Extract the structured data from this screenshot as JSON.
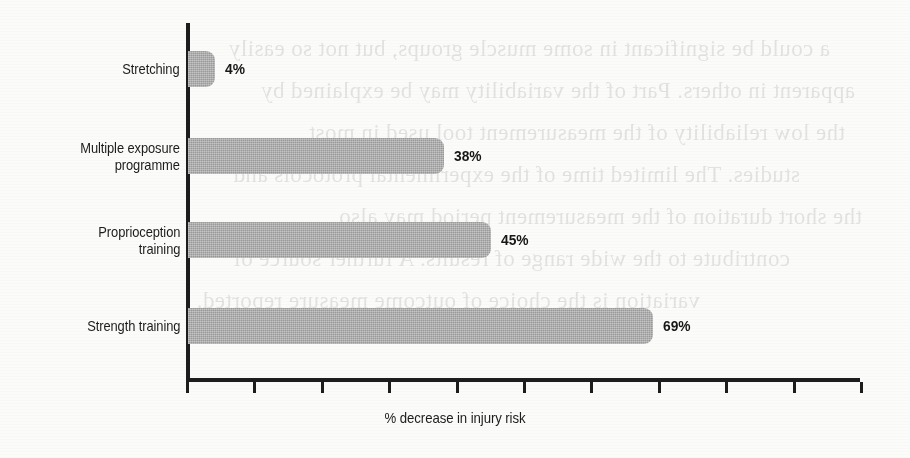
{
  "chart_data": {
    "type": "bar",
    "orientation": "horizontal",
    "title": "",
    "subtitle": "",
    "xlabel": "% decrease in injury risk",
    "ylabel": "",
    "categories": [
      "Stretching",
      "Multiple exposure\nprogramme",
      "Proprioception\ntraining",
      "Strength training"
    ],
    "values": [
      4,
      38,
      45,
      69
    ],
    "value_labels": [
      "4%",
      "38%",
      "45%",
      "69%"
    ],
    "xlim": [
      0,
      100
    ],
    "ylim": null,
    "x_tick_values": [
      0,
      10,
      20,
      30,
      40,
      50,
      60,
      70,
      80,
      90,
      100
    ],
    "x_tick_labels": [
      "",
      "",
      "",
      "",
      "",
      "",
      "",
      "",
      "",
      "",
      ""
    ],
    "grid": false,
    "legend": false,
    "legend_position": "none",
    "series": [
      {
        "name": "% decrease in injury risk",
        "values": [
          4,
          38,
          45,
          69
        ]
      }
    ],
    "colors": {
      "bar_fill": "#a9a9a9",
      "axis": "#1d1d1d",
      "text": "#1d1d1d",
      "background": "#fbfbf9"
    }
  },
  "axis": {
    "x_title": "% decrease in injury risk",
    "tick_count": 11
  },
  "ghost_text": {
    "lines": [
      "a could be significant in some muscle groups, but not so easily",
      "apparent in others. Part of the variability may be explained by",
      "the low reliability of the measurement tool used in most",
      "studies. The limited time of the experimental protocols and",
      "the short duration of the measurement period may also",
      "contribute to the wide range of results. A further source of",
      "variation is the choice of outcome measure reported."
    ]
  }
}
